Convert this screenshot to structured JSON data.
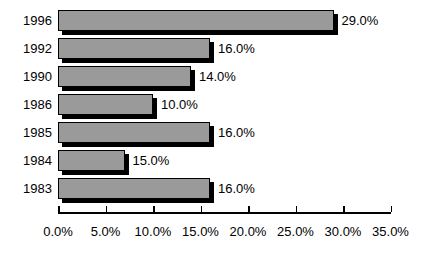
{
  "chart_data": {
    "type": "bar",
    "orientation": "horizontal",
    "title": "",
    "subtitle": "",
    "xlabel": "",
    "ylabel": "",
    "categories": [
      "1996",
      "1992",
      "1990",
      "1986",
      "1985",
      "1984",
      "1983"
    ],
    "values": [
      29.0,
      16.0,
      14.0,
      10.0,
      16.0,
      15.0,
      16.0
    ],
    "data_labels": [
      "29.0%",
      "16.0%",
      "14.0%",
      "10.0%",
      "16.0%",
      "15.0%",
      "16.0%"
    ],
    "drawn_values": [
      29.0,
      16.0,
      14.0,
      10.0,
      16.0,
      7.0,
      16.0
    ],
    "xlim": [
      0.0,
      35.0
    ],
    "xticks": [
      0.0,
      5.0,
      10.0,
      15.0,
      20.0,
      25.0,
      30.0,
      35.0
    ],
    "xtick_labels": [
      "0.0%",
      "5.0%",
      "10.0%",
      "15.0%",
      "20.0%",
      "25.0%",
      "30.0%",
      "35.0%"
    ],
    "grid": false,
    "legend": null,
    "legend_position": "none",
    "bar_fill_color": "#9a9a9a",
    "bar_edge_color": "#000000",
    "bar_shadow_color": "#000000",
    "axis_color": "#000000",
    "background_color": "#ffffff",
    "annotations": []
  },
  "layout": {
    "axis_origin_x": 58,
    "pixels_per_unit": 9.5,
    "row_pitch": 28,
    "first_row_top": 10,
    "bar_height": 21,
    "axis_y": 212,
    "tick_label_y": 224,
    "shadow_offset": 4
  }
}
